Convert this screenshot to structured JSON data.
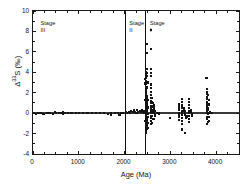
{
  "chart_data": {
    "type": "scatter",
    "title": "",
    "xlabel": "Age (Ma)",
    "ylabel_prefix": "Δ",
    "ylabel_sup": "33",
    "ylabel_suffix": "S (‰)",
    "ylabel": "Δ33S (‰)",
    "xlim": [
      0,
      4500
    ],
    "ylim": [
      -4,
      10
    ],
    "xticks": [
      0,
      1000,
      2000,
      3000,
      4000
    ],
    "xtick_labels": [
      "0",
      "1000",
      "2000",
      "3000",
      "4000"
    ],
    "xminor_step": 250,
    "yticks": [
      -4,
      -2,
      0,
      2,
      4,
      6,
      8,
      10
    ],
    "ytick_labels": [
      "-4",
      "-2",
      "0",
      "2",
      "4",
      "6",
      "8",
      "10"
    ],
    "yminor_step": 1,
    "grid": false,
    "legend": null,
    "marker": "square",
    "marker_color": "#141414",
    "frame_color": "#1a1a1a",
    "zero_line": {
      "y": 0,
      "color": "#3a3a3a"
    },
    "dividers": [
      {
        "x": 2000,
        "color": "#111111"
      },
      {
        "x": 2450,
        "color": "#111111"
      }
    ],
    "annotations": [
      {
        "name": "stage-iii",
        "text": "Stage",
        "number": "III",
        "x": 120,
        "y": 9.1
      },
      {
        "name": "stage-ii",
        "text": "Stage",
        "number": "II",
        "x": 2060,
        "y": 9.1
      },
      {
        "name": "stage-i",
        "text": "Stage",
        "number": "I",
        "x": 2510,
        "y": 9.1
      }
    ],
    "points": [
      [
        30,
        0.05
      ],
      [
        60,
        -0.05
      ],
      [
        120,
        0.0
      ],
      [
        175,
        0.05
      ],
      [
        230,
        -0.05
      ],
      [
        300,
        0.0
      ],
      [
        360,
        0.05
      ],
      [
        430,
        -0.05
      ],
      [
        490,
        0.1
      ],
      [
        500,
        0.0
      ],
      [
        560,
        0.0
      ],
      [
        620,
        0.05
      ],
      [
        660,
        0.1
      ],
      [
        665,
        -0.05
      ],
      [
        700,
        0.0
      ],
      [
        760,
        0.0
      ],
      [
        840,
        0.0
      ],
      [
        930,
        0.05
      ],
      [
        1010,
        0.0
      ],
      [
        1100,
        0.0
      ],
      [
        1190,
        0.0
      ],
      [
        1280,
        0.05
      ],
      [
        1370,
        0.0
      ],
      [
        1460,
        0.0
      ],
      [
        1550,
        0.0
      ],
      [
        1640,
        -0.1
      ],
      [
        1700,
        0.0
      ],
      [
        1710,
        -0.15
      ],
      [
        1790,
        0.05
      ],
      [
        1860,
        0.0
      ],
      [
        1880,
        -0.2
      ],
      [
        1900,
        -0.15
      ],
      [
        1930,
        0.0
      ],
      [
        1960,
        0.05
      ],
      [
        2030,
        0.1
      ],
      [
        2060,
        0.05
      ],
      [
        2090,
        0.15
      ],
      [
        2110,
        0.0
      ],
      [
        2150,
        0.2
      ],
      [
        2180,
        0.1
      ],
      [
        2210,
        0.35
      ],
      [
        2230,
        0.1
      ],
      [
        2260,
        0.05
      ],
      [
        2280,
        0.3
      ],
      [
        2300,
        0.15
      ],
      [
        2330,
        0.2
      ],
      [
        2360,
        0.1
      ],
      [
        2380,
        0.3
      ],
      [
        2400,
        0.15
      ],
      [
        2420,
        0.25
      ],
      [
        2430,
        0.05
      ],
      [
        2455,
        3.3
      ],
      [
        2458,
        2.9
      ],
      [
        2460,
        2.6
      ],
      [
        2462,
        2.3
      ],
      [
        2460,
        1.9
      ],
      [
        2463,
        1.6
      ],
      [
        2458,
        1.3
      ],
      [
        2461,
        1.0
      ],
      [
        2464,
        0.7
      ],
      [
        2459,
        0.4
      ],
      [
        2462,
        0.15
      ],
      [
        2466,
        0.0
      ],
      [
        2460,
        -0.2
      ],
      [
        2463,
        -0.5
      ],
      [
        2458,
        -0.8
      ],
      [
        2461,
        -1.1
      ],
      [
        2464,
        -1.4
      ],
      [
        2459,
        -1.7
      ],
      [
        2462,
        -1.95
      ],
      [
        2470,
        4.0
      ],
      [
        2472,
        3.7
      ],
      [
        2468,
        3.4
      ],
      [
        2474,
        3.1
      ],
      [
        2470,
        2.1
      ],
      [
        2473,
        1.75
      ],
      [
        2469,
        1.4
      ],
      [
        2472,
        1.05
      ],
      [
        2467,
        0.75
      ],
      [
        2471,
        0.5
      ],
      [
        2474,
        0.25
      ],
      [
        2468,
        0.05
      ],
      [
        2472,
        -0.3
      ],
      [
        2469,
        -0.6
      ],
      [
        2473,
        -0.9
      ],
      [
        2470,
        -1.25
      ],
      [
        2467,
        -1.6
      ],
      [
        2471,
        -1.9
      ],
      [
        2480,
        4.3
      ],
      [
        2482,
        3.9
      ],
      [
        2478,
        2.05
      ],
      [
        2484,
        1.7
      ],
      [
        2480,
        1.35
      ],
      [
        2483,
        1.0
      ],
      [
        2479,
        0.65
      ],
      [
        2482,
        0.3
      ],
      [
        2485,
        0.05
      ],
      [
        2478,
        -0.25
      ],
      [
        2481,
        -0.55
      ],
      [
        2484,
        -0.85
      ],
      [
        2480,
        -1.2
      ],
      [
        2483,
        -1.5
      ],
      [
        2490,
        5.9
      ],
      [
        2492,
        4.35
      ],
      [
        2488,
        3.6
      ],
      [
        2494,
        2.6
      ],
      [
        2490,
        1.55
      ],
      [
        2493,
        1.2
      ],
      [
        2489,
        0.85
      ],
      [
        2492,
        0.5
      ],
      [
        2495,
        0.2
      ],
      [
        2488,
        -0.1
      ],
      [
        2491,
        -0.4
      ],
      [
        2494,
        -0.75
      ],
      [
        2490,
        -1.05
      ],
      [
        2493,
        -1.35
      ],
      [
        2500,
        6.8
      ],
      [
        2502,
        3.0
      ],
      [
        2498,
        2.45
      ],
      [
        2504,
        1.3
      ],
      [
        2500,
        0.9
      ],
      [
        2503,
        0.55
      ],
      [
        2499,
        0.25
      ],
      [
        2502,
        -0.05
      ],
      [
        2505,
        -0.35
      ],
      [
        2498,
        -0.65
      ],
      [
        2501,
        -1.0
      ],
      [
        2504,
        -1.45
      ],
      [
        2570,
        8.1
      ],
      [
        2575,
        6.3
      ],
      [
        2580,
        4.35
      ],
      [
        2578,
        3.95
      ],
      [
        2582,
        3.6
      ],
      [
        2576,
        2.8
      ],
      [
        2584,
        2.45
      ],
      [
        2579,
        2.1
      ],
      [
        2583,
        1.8
      ],
      [
        2577,
        1.5
      ],
      [
        2585,
        1.2
      ],
      [
        2581,
        0.95
      ],
      [
        2588,
        0.7
      ],
      [
        2574,
        0.45
      ],
      [
        2586,
        0.2
      ],
      [
        2580,
        0.0
      ],
      [
        2583,
        -0.25
      ],
      [
        2577,
        -0.5
      ],
      [
        2587,
        -0.8
      ],
      [
        2582,
        -1.1
      ],
      [
        2590,
        1.45
      ],
      [
        2595,
        1.1
      ],
      [
        2600,
        0.95
      ],
      [
        2605,
        0.6
      ],
      [
        2598,
        0.3
      ],
      [
        2610,
        0.15
      ],
      [
        2615,
        0.0
      ],
      [
        2602,
        -0.3
      ],
      [
        2620,
        -0.6
      ],
      [
        2608,
        -0.95
      ],
      [
        2625,
        1.0
      ],
      [
        2635,
        0.75
      ],
      [
        2645,
        0.45
      ],
      [
        2655,
        0.25
      ],
      [
        2640,
        0.0
      ],
      [
        2660,
        -0.25
      ],
      [
        2650,
        -0.55
      ],
      [
        2670,
        -0.2
      ],
      [
        2700,
        0.0
      ],
      [
        2720,
        0.05
      ],
      [
        2745,
        0.0
      ],
      [
        2760,
        -0.1
      ],
      [
        3000,
        -0.45
      ],
      [
        3180,
        0.85
      ],
      [
        3185,
        0.55
      ],
      [
        3190,
        0.3
      ],
      [
        3188,
        0.05
      ],
      [
        3192,
        -0.15
      ],
      [
        3186,
        -0.4
      ],
      [
        3194,
        -0.65
      ],
      [
        3250,
        1.35
      ],
      [
        3255,
        1.05
      ],
      [
        3252,
        0.75
      ],
      [
        3258,
        0.5
      ],
      [
        3254,
        0.25
      ],
      [
        3260,
        0.05
      ],
      [
        3250,
        -0.2
      ],
      [
        3256,
        -0.45
      ],
      [
        3262,
        -0.75
      ],
      [
        3253,
        -1.05
      ],
      [
        3258,
        -1.6
      ],
      [
        3300,
        0.45
      ],
      [
        3310,
        0.2
      ],
      [
        3320,
        0.0
      ],
      [
        3330,
        -0.2
      ],
      [
        3340,
        -0.35
      ],
      [
        3350,
        -0.5
      ],
      [
        3360,
        -0.3
      ],
      [
        3370,
        -0.4
      ],
      [
        3315,
        -1.95
      ],
      [
        3400,
        1.4
      ],
      [
        3405,
        1.1
      ],
      [
        3402,
        0.8
      ],
      [
        3408,
        0.5
      ],
      [
        3404,
        0.25
      ],
      [
        3410,
        0.0
      ],
      [
        3400,
        -0.3
      ],
      [
        3406,
        -0.6
      ],
      [
        3412,
        -0.9
      ],
      [
        3450,
        0.3
      ],
      [
        3460,
        0.1
      ],
      [
        3470,
        -0.1
      ],
      [
        3480,
        -0.25
      ],
      [
        3790,
        3.4
      ],
      [
        3800,
        2.35
      ],
      [
        3805,
        2.1
      ],
      [
        3802,
        1.85
      ],
      [
        3808,
        1.6
      ],
      [
        3804,
        1.35
      ],
      [
        3810,
        1.1
      ],
      [
        3800,
        0.9
      ],
      [
        3806,
        0.65
      ],
      [
        3812,
        0.45
      ],
      [
        3803,
        0.25
      ],
      [
        3809,
        0.05
      ],
      [
        3815,
        -0.1
      ],
      [
        3801,
        -0.35
      ],
      [
        3807,
        -0.6
      ],
      [
        3813,
        -0.85
      ],
      [
        3804,
        -1.1
      ],
      [
        3830,
        1.75
      ],
      [
        3835,
        1.3
      ],
      [
        3840,
        0.85
      ],
      [
        3832,
        0.35
      ],
      [
        3838,
        0.0
      ],
      [
        3842,
        -0.4
      ],
      [
        3836,
        -0.75
      ],
      [
        3870,
        0.15
      ],
      [
        3885,
        0.0
      ],
      [
        3900,
        0.05
      ],
      [
        3920,
        0.0
      ]
    ]
  }
}
